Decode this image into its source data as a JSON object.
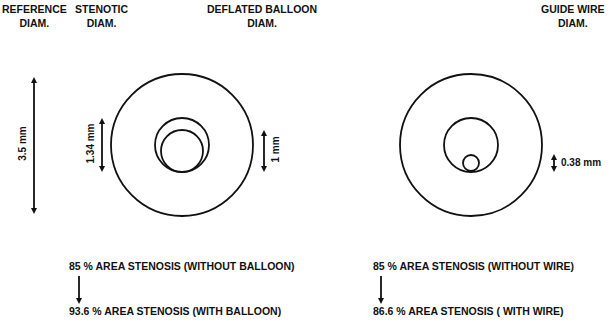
{
  "headers": {
    "reference": {
      "line1": "REFERENCE",
      "line2": "DIAM."
    },
    "stenotic": {
      "line1": "STENOTIC",
      "line2": "DIAM."
    },
    "balloon": {
      "line1": "DEFLATED BALLOON",
      "line2": "DIAM."
    },
    "guidewire": {
      "line1": "GUIDE WIRE",
      "line2": "DIAM."
    }
  },
  "dimensions": {
    "reference": "3.5 mm",
    "stenotic": "1.34 mm",
    "balloon": "1 mm",
    "guidewire": "0.38 mm"
  },
  "left_panel": {
    "before": "85 % AREA STENOSIS (WITHOUT BALLOON)",
    "after": "93.6 % AREA STENOSIS (WITH BALLOON)"
  },
  "right_panel": {
    "before": "85 % AREA STENOSIS (WITHOUT WIRE)",
    "after": "86.6 % AREA STENOSIS ( WITH WIRE)"
  },
  "colors": {
    "stroke": "#111111",
    "background": "#ffffff"
  }
}
